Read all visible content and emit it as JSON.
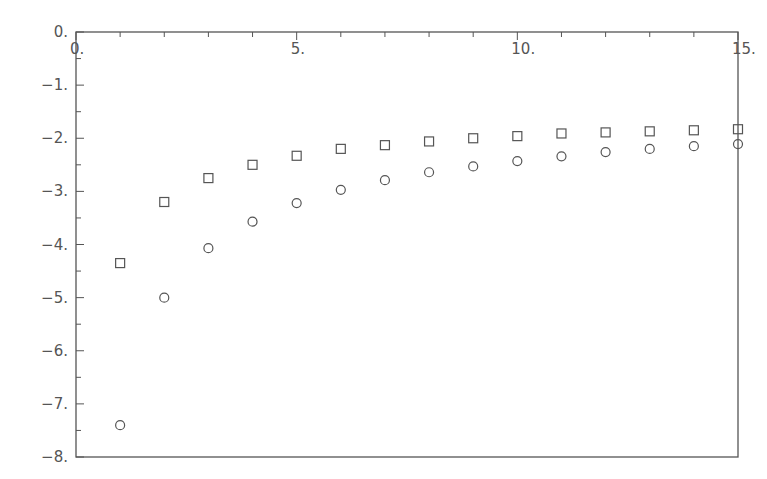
{
  "chart_data": {
    "type": "scatter",
    "title": "",
    "xlabel": "",
    "ylabel": "",
    "xlim": [
      0,
      15
    ],
    "ylim": [
      -8,
      0
    ],
    "grid": false,
    "legend": null,
    "x_ticks": [
      0,
      5,
      10,
      15
    ],
    "x_tick_labels": [
      "0.",
      "5.",
      "10.",
      "15."
    ],
    "x_minor_step": 1,
    "y_ticks": [
      0,
      -1,
      -2,
      -3,
      -4,
      -5,
      -6,
      -7,
      -8
    ],
    "y_tick_labels": [
      "0.",
      "−1.",
      "−2.",
      "−3.",
      "−4.",
      "−5.",
      "−6.",
      "−7.",
      "−8."
    ],
    "y_minor_step": 0.5,
    "x_axis_position": "top",
    "series": [
      {
        "name": "squares",
        "marker": "square",
        "x": [
          1,
          2,
          3,
          4,
          5,
          6,
          7,
          8,
          9,
          10,
          11,
          12,
          13,
          14,
          15
        ],
        "values": [
          -4.35,
          -3.2,
          -2.75,
          -2.5,
          -2.33,
          -2.2,
          -2.13,
          -2.06,
          -2.0,
          -1.96,
          -1.91,
          -1.89,
          -1.87,
          -1.85,
          -1.83
        ]
      },
      {
        "name": "circles",
        "marker": "circle",
        "x": [
          1,
          2,
          3,
          4,
          5,
          6,
          7,
          8,
          9,
          10,
          11,
          12,
          13,
          14,
          15
        ],
        "values": [
          -7.4,
          -5.0,
          -4.07,
          -3.57,
          -3.22,
          -2.97,
          -2.79,
          -2.64,
          -2.53,
          -2.43,
          -2.34,
          -2.26,
          -2.2,
          -2.15,
          -2.11
        ]
      }
    ],
    "colors": {
      "axis": "#555555",
      "marker": "#555555",
      "background": "#ffffff"
    }
  }
}
